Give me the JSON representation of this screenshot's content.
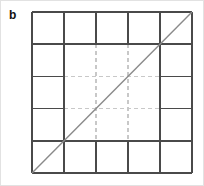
{
  "figure": {
    "panel_label": "b",
    "label_position": {
      "x": 8,
      "y": 8
    },
    "background_color": "#ffffff",
    "page_border_color": "#e2e2e2"
  },
  "grid": {
    "columns": 5,
    "rows": 5,
    "origin": {
      "x": 31,
      "y": 11
    },
    "size": {
      "width": 160,
      "height": 161
    },
    "cell_width": 32,
    "cell_height": 32.2,
    "x_positions": [
      0,
      32,
      64,
      96,
      128,
      160
    ],
    "y_positions": [
      0,
      32.2,
      64.4,
      96.6,
      128.8,
      161
    ],
    "solid_line_color": "#4a4a4a",
    "solid_line_width": 1.6,
    "dashed_line_color": "#c8c8c8",
    "dashed_line_width": 1.1,
    "dash_pattern": "4,3",
    "outer_ring_style": "solid",
    "inner_region_style": "dashed",
    "inner_region": {
      "col_start": 1,
      "col_end": 4,
      "row_start": 1,
      "row_end": 4
    }
  },
  "diagonal": {
    "from": {
      "x": 0,
      "y": 161
    },
    "to": {
      "x": 160,
      "y": 0
    },
    "color": "#8a8a8a",
    "width": 1.4,
    "description": "bottom-left to top-right diagonal"
  }
}
